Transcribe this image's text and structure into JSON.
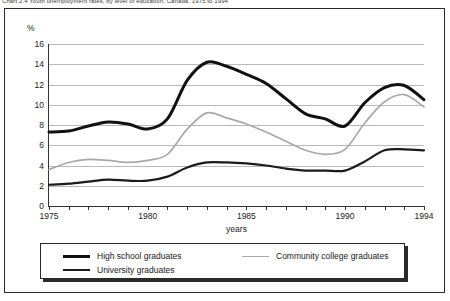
{
  "top_caption": "Chart 2.4 Youth unemployment rates, by level of education, Canada, 1975 to 1994",
  "axes": {
    "y_unit_label": "%",
    "y_ticks": [
      0,
      2,
      4,
      6,
      8,
      10,
      12,
      14,
      16
    ],
    "x_title": "years",
    "x_ticks_labeled": [
      "1975",
      "1980",
      "1985",
      "1990",
      "1994"
    ]
  },
  "legend": {
    "items": [
      {
        "label": "High school graduates",
        "swatch": "sw-hs",
        "color": "#111111"
      },
      {
        "label": "Community college graduates",
        "swatch": "sw-cc",
        "color": "#a8a8a8"
      },
      {
        "label": "University graduates",
        "swatch": "sw-uni",
        "color": "#1b1b1b"
      }
    ]
  },
  "chart_data": {
    "type": "line",
    "title": "",
    "xlabel": "years",
    "ylabel": "%",
    "xlim": [
      1975,
      1994
    ],
    "ylim": [
      0,
      16
    ],
    "ytick_step": 2,
    "grid": true,
    "legend_position": "bottom",
    "x": [
      1975,
      1976,
      1977,
      1978,
      1979,
      1980,
      1981,
      1982,
      1983,
      1984,
      1985,
      1986,
      1987,
      1988,
      1989,
      1990,
      1991,
      1992,
      1993,
      1994
    ],
    "series": [
      {
        "name": "High school graduates",
        "color": "#111111",
        "values": [
          7.3,
          7.4,
          7.9,
          8.3,
          8.1,
          7.6,
          8.6,
          12.4,
          14.2,
          13.8,
          13.0,
          12.1,
          10.6,
          9.1,
          8.6,
          7.9,
          10.2,
          11.7,
          11.9,
          10.5
        ]
      },
      {
        "name": "Community college graduates",
        "color": "#a8a8a8",
        "values": [
          3.6,
          4.3,
          4.6,
          4.5,
          4.3,
          4.5,
          5.1,
          7.6,
          9.2,
          8.7,
          8.1,
          7.3,
          6.4,
          5.5,
          5.1,
          5.6,
          8.2,
          10.3,
          11.0,
          9.8
        ]
      },
      {
        "name": "University graduates",
        "color": "#1b1b1b",
        "values": [
          2.1,
          2.2,
          2.4,
          2.6,
          2.5,
          2.5,
          2.9,
          3.8,
          4.3,
          4.3,
          4.2,
          4.0,
          3.7,
          3.5,
          3.5,
          3.5,
          4.4,
          5.5,
          5.6,
          5.5
        ]
      }
    ]
  }
}
